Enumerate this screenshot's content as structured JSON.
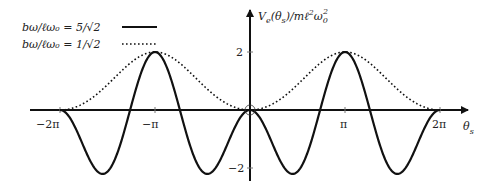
{
  "chart_data": {
    "type": "line",
    "title": "",
    "xlabel": "θs",
    "ylabel": "Ve(θs)/mℓ²ω0²",
    "x_ticks": [
      {
        "value": -6.2832,
        "label": "−2π"
      },
      {
        "value": -3.1416,
        "label": "−π"
      },
      {
        "value": 3.1416,
        "label": "π"
      },
      {
        "value": 6.2832,
        "label": "2π"
      }
    ],
    "y_ticks": [
      {
        "value": 2,
        "label": "2"
      },
      {
        "value": -2,
        "label": "−2"
      }
    ],
    "xlim": [
      -6.28,
      6.28
    ],
    "ylim": [
      -2.2,
      2.2
    ],
    "grid": false,
    "legend_position": "top-left",
    "origin_marker": "open circle at (0,0)",
    "series": [
      {
        "name": "bω/ℓω0 = 5/√2",
        "style": "solid",
        "formula": "1 - cos(θ) - 3.125·sin²(θ)",
        "x": [
          -6.2832,
          -5.4978,
          -4.7124,
          -3.927,
          -3.1416,
          -2.3562,
          -1.5708,
          -0.7854,
          0,
          0.7854,
          1.5708,
          2.3562,
          3.1416,
          3.927,
          4.7124,
          5.4978,
          6.2832
        ],
        "values": [
          0,
          -1.27,
          -2.125,
          -0.27,
          2,
          -0.27,
          -2.125,
          -1.27,
          0,
          -1.27,
          -2.125,
          -0.27,
          2,
          -0.27,
          -2.125,
          -1.27,
          0
        ]
      },
      {
        "name": "bω/ℓω0 = 1/√2",
        "style": "dotted",
        "formula": "1 - cos(θ) - 0.125·sin²(θ)",
        "x": [
          -6.2832,
          -5.4978,
          -4.7124,
          -3.927,
          -3.1416,
          -2.3562,
          -1.5708,
          -0.7854,
          0,
          0.7854,
          1.5708,
          2.3562,
          3.1416,
          3.927,
          4.7124,
          5.4978,
          6.2832
        ],
        "values": [
          0,
          0.23,
          0.875,
          1.64,
          2,
          1.64,
          0.875,
          0.23,
          0,
          0.23,
          0.875,
          1.64,
          2,
          1.64,
          0.875,
          0.23,
          0
        ]
      }
    ]
  },
  "legend": {
    "items": [
      {
        "label": "bω/ℓω₀ = 5/√2",
        "style": "solid"
      },
      {
        "label": "bω/ℓω₀ = 1/√2",
        "style": "dotted"
      }
    ]
  },
  "axes": {
    "y_label_main": "V",
    "y_label_sub": "e",
    "y_label_rest": "(θ",
    "y_label_sub2": "s",
    "y_label_tail": ")/mℓ",
    "y_label_sup": "2",
    "y_label_omega": "ω",
    "y_label_omega_sub": "0",
    "y_label_omega_sup": "2",
    "x_label_main": "θ",
    "x_label_sub": "s",
    "tick_labels": {
      "neg2pi": "−2π",
      "negpi": "−π",
      "pi": "π",
      "twopi": "2π",
      "y2": "2",
      "yneg2": "−2"
    }
  },
  "colors": {
    "line": "#111111",
    "text": "#222222",
    "background": "#ffffff"
  }
}
